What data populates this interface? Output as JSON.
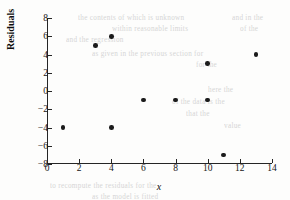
{
  "chart_data": {
    "type": "scatter",
    "title": "",
    "xlabel": "x",
    "ylabel": "Residuals",
    "xlim": [
      0,
      14
    ],
    "ylim": [
      -8,
      8
    ],
    "xticks": [
      0,
      2,
      4,
      6,
      8,
      10,
      12,
      14
    ],
    "yticks": [
      8,
      6,
      4,
      2,
      0,
      -2,
      -4,
      -6,
      -8
    ],
    "xtick_labels": [
      "0",
      "2",
      "4",
      "6",
      "8",
      "10",
      "12",
      "14"
    ],
    "ytick_labels": [
      "8",
      "6",
      "4",
      "2",
      "0",
      "−2",
      "−4",
      "−6",
      "−8"
    ],
    "grid": false,
    "legend": null,
    "marker_color": "#1b1b1b",
    "axis_color": "#252525",
    "points": [
      {
        "x": 1,
        "y": -4
      },
      {
        "x": 3,
        "y": 5
      },
      {
        "x": 4,
        "y": 6
      },
      {
        "x": 4,
        "y": -4
      },
      {
        "x": 6,
        "y": -1
      },
      {
        "x": 8,
        "y": -1
      },
      {
        "x": 10,
        "y": 3
      },
      {
        "x": 10,
        "y": -1
      },
      {
        "x": 11,
        "y": -7
      },
      {
        "x": 13,
        "y": 4
      }
    ]
  },
  "background_bleed": [
    {
      "text": "the contents of which is unknown",
      "x": 78,
      "y": 14
    },
    {
      "text": "and in the",
      "x": 232,
      "y": 14
    },
    {
      "text": "within reasonable limits",
      "x": 112,
      "y": 25
    },
    {
      "text": "of the",
      "x": 240,
      "y": 25
    },
    {
      "text": "and the regression",
      "x": 66,
      "y": 36
    },
    {
      "text": "as given in the previous section for",
      "x": 92,
      "y": 50
    },
    {
      "text": "for the",
      "x": 196,
      "y": 61
    },
    {
      "text": "here the",
      "x": 208,
      "y": 86
    },
    {
      "text": "of the data is the",
      "x": 172,
      "y": 98
    },
    {
      "text": "that the",
      "x": 186,
      "y": 110
    },
    {
      "text": "value",
      "x": 224,
      "y": 122
    },
    {
      "text": "to recompute the residuals for the",
      "x": 50,
      "y": 182
    },
    {
      "text": "as the model is fitted",
      "x": 92,
      "y": 193
    }
  ]
}
